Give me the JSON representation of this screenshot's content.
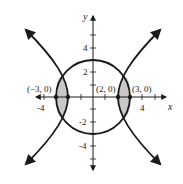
{
  "diagram": {
    "type": "conic-graph",
    "axes": {
      "x_label": "x",
      "y_label": "y",
      "x_ticks": [
        "-4",
        "4"
      ],
      "y_ticks": [
        "4",
        "2",
        "-2",
        "-4"
      ]
    },
    "points": [
      {
        "label": "(−3, 0)",
        "x": -3,
        "y": 0
      },
      {
        "label": "(2, 0)",
        "x": 2,
        "y": 0
      },
      {
        "label": "(3, 0)",
        "x": 3,
        "y": 0
      }
    ],
    "colors": {
      "stroke": "#1a1a1a",
      "shade": "#c8c8c8",
      "background": "#ffffff"
    }
  }
}
